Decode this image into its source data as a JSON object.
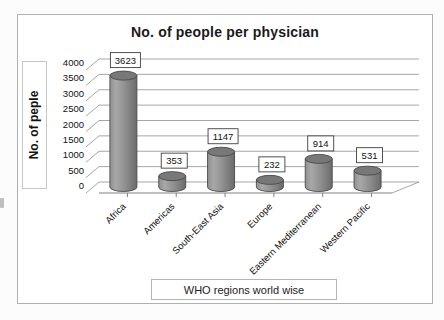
{
  "page": {
    "background": "#fcfcfc"
  },
  "chart_data": {
    "type": "bar",
    "style": "3d-cylinder",
    "title": "No. of people per physician",
    "ylabel": "No. of peple",
    "xlabel": "WHO regions world wise",
    "categories": [
      "Africa",
      "Americas",
      "South-East Asia",
      "Europe",
      "Eastern Mediterranean",
      "Western Pacific"
    ],
    "values": [
      3623,
      353,
      1147,
      232,
      914,
      531
    ],
    "data_labels": true,
    "legend": false,
    "grid": true,
    "ylim": [
      0,
      4000
    ],
    "ytick_step": 500,
    "yticks": [
      0,
      500,
      1000,
      1500,
      2000,
      2500,
      3000,
      3500,
      4000
    ],
    "colors": {
      "bar_body_light": "#a8a8a8",
      "bar_body": "#909090",
      "bar_body_dark": "#6b6b6b",
      "bar_top": "#787878",
      "outline": "#4a4a4a",
      "grid": "#9c9c9c",
      "axis": "#808080",
      "frame_border": "#b0b0b0",
      "label_box_border": "#3f3f3f",
      "text": "#111111"
    }
  }
}
